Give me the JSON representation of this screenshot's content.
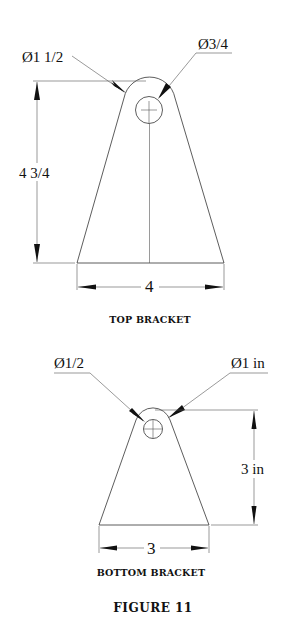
{
  "figure": {
    "title": "FIGURE 11"
  },
  "top_bracket": {
    "caption": "TOP BRACKET",
    "outer_diameter_label": "Ø1 1/2",
    "hole_diameter_label": "Ø3/4",
    "height_label": "4 3/4",
    "width_label": "4"
  },
  "bottom_bracket": {
    "caption": "BOTTOM BRACKET",
    "hole_diameter_label": "Ø1/2",
    "outer_diameter_label": "Ø1 in",
    "height_label": "3 in",
    "width_label": "3"
  }
}
